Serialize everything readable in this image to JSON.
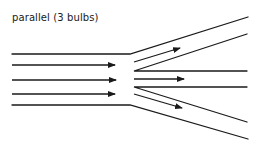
{
  "title": "parallel (3 bulbs)",
  "colors": {
    "line": "#1a1a1a",
    "background": "#ffffff"
  },
  "diagram": {
    "incoming_arrows": 3,
    "branches": 3
  }
}
